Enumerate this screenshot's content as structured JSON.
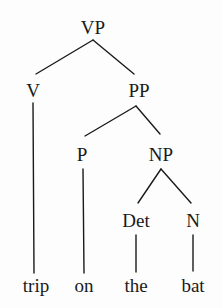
{
  "diagram": {
    "type": "syntax-tree",
    "nodes": {
      "vp": {
        "label": "VP"
      },
      "v": {
        "label": "V"
      },
      "pp": {
        "label": "PP"
      },
      "p": {
        "label": "P"
      },
      "np": {
        "label": "NP"
      },
      "det": {
        "label": "Det"
      },
      "n": {
        "label": "N"
      }
    },
    "words": {
      "trip": {
        "label": "trip"
      },
      "on": {
        "label": "on"
      },
      "the": {
        "label": "the"
      },
      "bat": {
        "label": "bat"
      }
    },
    "edges": [
      [
        "VP",
        "V"
      ],
      [
        "VP",
        "PP"
      ],
      [
        "PP",
        "P"
      ],
      [
        "PP",
        "NP"
      ],
      [
        "NP",
        "Det"
      ],
      [
        "NP",
        "N"
      ],
      [
        "V",
        "trip"
      ],
      [
        "P",
        "on"
      ],
      [
        "Det",
        "the"
      ],
      [
        "N",
        "bat"
      ]
    ],
    "colors": {
      "ink": "#1a1a1a",
      "background": "#fdfdfd"
    }
  }
}
